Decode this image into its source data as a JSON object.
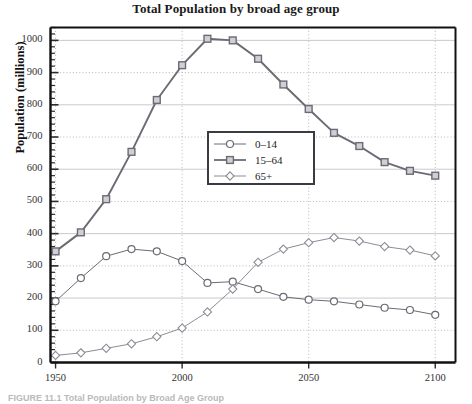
{
  "chart_data": {
    "type": "line",
    "title": "Total Population by broad age group",
    "xlabel": "",
    "ylabel": "Population (millions)",
    "x": [
      1950,
      1960,
      1970,
      1980,
      1990,
      2000,
      2010,
      2020,
      2030,
      2040,
      2050,
      2060,
      2070,
      2080,
      2090,
      2100
    ],
    "xlim": [
      1948,
      2108
    ],
    "ylim": [
      0,
      1040
    ],
    "xticks": [
      1950,
      2000,
      2050,
      2100
    ],
    "yticks": [
      0,
      100,
      200,
      300,
      400,
      500,
      600,
      700,
      800,
      900,
      1000
    ],
    "grid": true,
    "legend_position": "center",
    "series": [
      {
        "name": "0–14",
        "marker": "circle",
        "color": "#6b6b75",
        "values": [
          190,
          262,
          330,
          352,
          345,
          315,
          247,
          251,
          228,
          204,
          195,
          190,
          180,
          170,
          163,
          148
        ]
      },
      {
        "name": "15–64",
        "marker": "square",
        "color": "#6b6b75",
        "values": [
          345,
          404,
          507,
          654,
          815,
          923,
          1005,
          1000,
          943,
          863,
          787,
          713,
          672,
          622,
          595,
          580
        ]
      },
      {
        "name": "65+",
        "marker": "diamond",
        "color": "#8c8c96",
        "values": [
          22,
          30,
          44,
          58,
          80,
          107,
          157,
          228,
          311,
          352,
          372,
          388,
          377,
          360,
          349,
          331
        ]
      }
    ]
  },
  "legend": {
    "items": [
      {
        "label": "0–14"
      },
      {
        "label": "15–64"
      },
      {
        "label": "65+"
      }
    ]
  },
  "axis": {
    "y_tick_labels": [
      "1000",
      "900",
      "800",
      "700",
      "600",
      "500",
      "400",
      "300",
      "200",
      "100",
      "0"
    ],
    "x_tick_labels": [
      "1950",
      "2000",
      "2050",
      "2100"
    ]
  },
  "caption": {
    "text": "FIGURE 11.1  Total Population by Broad Age Group"
  }
}
